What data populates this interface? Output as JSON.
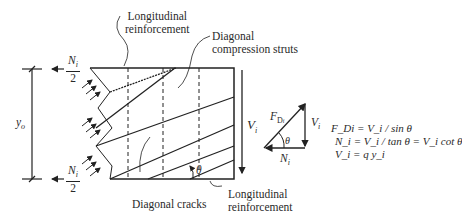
{
  "labels": {
    "long_reinf_top": [
      "Longitudinal",
      "reinforcement"
    ],
    "diag_struts": [
      "Diagonal",
      "compression struts"
    ],
    "diag_cracks": "Diagonal cracks",
    "long_reinf_bottom": [
      "Longitudinal",
      "reinforcement"
    ],
    "force_top": {
      "num": "N",
      "sub": "i",
      "den": "2"
    },
    "force_bottom": {
      "num": "N",
      "sub": "i",
      "den": "2"
    },
    "dimension": {
      "sym": "y",
      "sub": "o"
    },
    "shear": {
      "sym": "V",
      "sub": "i"
    },
    "angle": "θ"
  },
  "force_triangle": {
    "hyp": {
      "sym": "F",
      "sub": "D",
      "subsub": "i"
    },
    "vertical": {
      "sym": "V",
      "sub": "i"
    },
    "horizontal": {
      "sym": "N",
      "sub": "i"
    },
    "angle": "θ"
  },
  "equations": [
    "F_Di = V_i / sin θ",
    "N_i = V_i / tan θ = V_i cot θ",
    "V_i = q y_i"
  ]
}
